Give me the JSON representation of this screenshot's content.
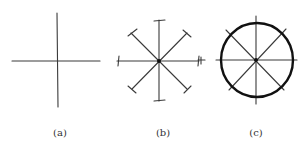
{
  "figure": {
    "panels": [
      {
        "id": "a",
        "label": "(a)",
        "description": "Two perpendicular lines crossing (horizontal and vertical axes)"
      },
      {
        "id": "b",
        "label": "(b)",
        "description": "Eight radial spokes from a center dot, each ending in a short tick mark"
      },
      {
        "id": "c",
        "label": "(c)",
        "description": "Eight radial spokes from a center dot enclosed by a bold circle"
      }
    ],
    "colors": {
      "ink": "#111111",
      "thin_ink": "#3a3a3a",
      "background": "#ffffff"
    }
  }
}
